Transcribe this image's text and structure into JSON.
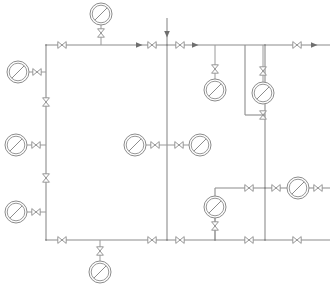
{
  "diagram": {
    "type": "p-and-id",
    "canvas": {
      "width": 330,
      "height": 290
    },
    "colors": {
      "background": "#ffffff",
      "line": "#8c8c8c",
      "symbol_fill": "#ffffff",
      "arrow": "#6e6e6e"
    },
    "legend": {
      "gauge_symbol": "pressure-gauge",
      "valve_symbol": "gate-valve-bowtie",
      "flow_symbol": "flow-direction-arrow"
    },
    "pipes": [
      {
        "name": "header-top-main",
        "orientation": "horizontal",
        "x1": 46,
        "y1": 45,
        "x2": 330,
        "y2": 45
      },
      {
        "name": "riser-left-main",
        "orientation": "vertical",
        "x1": 46,
        "y1": 45,
        "x2": 46,
        "y2": 240
      },
      {
        "name": "header-bottom-main",
        "orientation": "horizontal",
        "x1": 46,
        "y1": 240,
        "x2": 330,
        "y2": 240
      },
      {
        "name": "riser-center-main",
        "orientation": "vertical",
        "x1": 167,
        "y1": 18,
        "x2": 167,
        "y2": 240
      },
      {
        "name": "riser-right-main",
        "orientation": "vertical",
        "x1": 265,
        "y1": 45,
        "x2": 265,
        "y2": 240
      },
      {
        "name": "branch-right-mid-horizontal",
        "orientation": "horizontal",
        "x1": 215,
        "y1": 188,
        "x2": 330,
        "y2": 188
      },
      {
        "name": "branch-right-mid-drop",
        "orientation": "vertical",
        "x1": 215,
        "y1": 188,
        "x2": 215,
        "y2": 240
      },
      {
        "name": "tap-right-gauge-riser",
        "orientation": "vertical",
        "x1": 245,
        "y1": 45,
        "x2": 245,
        "y2": 115
      },
      {
        "name": "tap-right-gauge-crossover",
        "orientation": "horizontal",
        "x1": 245,
        "y1": 115,
        "x2": 265,
        "y2": 115
      }
    ],
    "gauges": [
      {
        "id": "PG-01",
        "name": "gauge-top-center",
        "cx": 101,
        "cy": 14,
        "r": 11,
        "tap": "top-header",
        "stem": {
          "x": 101,
          "y1": 25,
          "y2": 45
        }
      },
      {
        "id": "PG-02",
        "name": "gauge-left-upper",
        "cx": 18,
        "cy": 72,
        "r": 11,
        "tap": "left-riser",
        "stem": {
          "x1": 29,
          "x2": 46,
          "y": 72
        }
      },
      {
        "id": "PG-03",
        "name": "gauge-left-middle",
        "cx": 16,
        "cy": 145,
        "r": 11,
        "tap": "left-riser",
        "stem": {
          "x1": 27,
          "x2": 46,
          "y": 145
        }
      },
      {
        "id": "PG-04",
        "name": "gauge-left-lower",
        "cx": 16,
        "cy": 212,
        "r": 11,
        "tap": "left-riser",
        "stem": {
          "x1": 27,
          "x2": 46,
          "y": 212
        }
      },
      {
        "id": "PG-05",
        "name": "gauge-center-left",
        "cx": 135,
        "cy": 145,
        "r": 11,
        "tap": "center-riser",
        "stem": {
          "x1": 146,
          "x2": 167,
          "y": 145
        }
      },
      {
        "id": "PG-06",
        "name": "gauge-center-right",
        "cx": 200,
        "cy": 145,
        "r": 11,
        "tap": "center-riser",
        "stem": {
          "x1": 167,
          "x2": 189,
          "y": 145
        }
      },
      {
        "id": "PG-07",
        "name": "gauge-upper-right-a",
        "cx": 215,
        "cy": 90,
        "r": 11,
        "tap": "top-header",
        "stem": {
          "x": 215,
          "y1": 45,
          "y2": 79
        }
      },
      {
        "id": "PG-08",
        "name": "gauge-upper-right-b",
        "cx": 263,
        "cy": 93,
        "r": 11,
        "tap": "top-header",
        "stem": {
          "x": 263,
          "y1": 45,
          "y2": 82
        }
      },
      {
        "id": "PG-09",
        "name": "gauge-lower-right-branch",
        "cx": 215,
        "cy": 207,
        "r": 11,
        "tap": "branch-right-mid",
        "stem": {
          "x": 215,
          "y1": 196,
          "y2": 240
        }
      },
      {
        "id": "PG-10",
        "name": "gauge-far-right",
        "cx": 298,
        "cy": 188,
        "r": 11,
        "tap": "branch-right-mid",
        "stem": {
          "x1": 287,
          "x2": 309,
          "y": 188
        }
      },
      {
        "id": "PG-11",
        "name": "gauge-bottom-center",
        "cx": 100,
        "cy": 272,
        "r": 11,
        "tap": "bottom-header",
        "stem": {
          "x": 100,
          "y1": 240,
          "y2": 261
        }
      }
    ],
    "valves": [
      {
        "id": "V-01",
        "name": "valve-gauge-top-center",
        "cx": 101,
        "cy": 33,
        "orientation": "vertical"
      },
      {
        "id": "V-02",
        "name": "valve-top-header-left",
        "cx": 62,
        "cy": 45,
        "orientation": "horizontal"
      },
      {
        "id": "V-03",
        "name": "valve-top-header-center-left",
        "cx": 152,
        "cy": 45,
        "orientation": "horizontal"
      },
      {
        "id": "V-04",
        "name": "valve-top-header-center-right",
        "cx": 180,
        "cy": 45,
        "orientation": "horizontal"
      },
      {
        "id": "V-05",
        "name": "valve-top-header-right",
        "cx": 297,
        "cy": 45,
        "orientation": "horizontal"
      },
      {
        "id": "V-06",
        "name": "valve-gauge-left-upper",
        "cx": 37,
        "cy": 72,
        "orientation": "horizontal"
      },
      {
        "id": "V-07",
        "name": "valve-left-riser-upper",
        "cx": 46,
        "cy": 102,
        "orientation": "vertical"
      },
      {
        "id": "V-08",
        "name": "valve-left-riser-lower",
        "cx": 46,
        "cy": 178,
        "orientation": "vertical"
      },
      {
        "id": "V-09",
        "name": "valve-gauge-left-middle",
        "cx": 36,
        "cy": 145,
        "orientation": "horizontal"
      },
      {
        "id": "V-10",
        "name": "valve-gauge-left-lower",
        "cx": 36,
        "cy": 212,
        "orientation": "horizontal"
      },
      {
        "id": "V-11",
        "name": "valve-gauge-center-left",
        "cx": 155,
        "cy": 145,
        "orientation": "horizontal"
      },
      {
        "id": "V-12",
        "name": "valve-gauge-center-right",
        "cx": 179,
        "cy": 145,
        "orientation": "horizontal"
      },
      {
        "id": "V-13",
        "name": "valve-gauge-upper-right-a",
        "cx": 215,
        "cy": 69,
        "orientation": "vertical"
      },
      {
        "id": "V-14",
        "name": "valve-gauge-upper-right-b-top",
        "cx": 263,
        "cy": 71,
        "orientation": "vertical"
      },
      {
        "id": "V-15",
        "name": "valve-gauge-upper-right-b-bottom",
        "cx": 263,
        "cy": 115,
        "orientation": "vertical"
      },
      {
        "id": "V-16",
        "name": "valve-branch-right-left",
        "cx": 249,
        "cy": 188,
        "orientation": "horizontal"
      },
      {
        "id": "V-17",
        "name": "valve-branch-right-center",
        "cx": 276,
        "cy": 188,
        "orientation": "horizontal"
      },
      {
        "id": "V-18",
        "name": "valve-branch-right-far",
        "cx": 318,
        "cy": 188,
        "orientation": "horizontal"
      },
      {
        "id": "V-19",
        "name": "valve-gauge-lower-right-branch",
        "cx": 215,
        "cy": 226,
        "orientation": "vertical"
      },
      {
        "id": "V-20",
        "name": "valve-bottom-header-left",
        "cx": 62,
        "cy": 240,
        "orientation": "horizontal"
      },
      {
        "id": "V-21",
        "name": "valve-gauge-bottom-center",
        "cx": 100,
        "cy": 251,
        "orientation": "vertical"
      },
      {
        "id": "V-22",
        "name": "valve-bottom-header-center",
        "cx": 152,
        "cy": 240,
        "orientation": "horizontal"
      },
      {
        "id": "V-23",
        "name": "valve-bottom-header-right-a",
        "cx": 180,
        "cy": 240,
        "orientation": "horizontal"
      },
      {
        "id": "V-24",
        "name": "valve-bottom-header-right-b",
        "cx": 249,
        "cy": 240,
        "orientation": "horizontal"
      },
      {
        "id": "V-25",
        "name": "valve-bottom-header-far-right",
        "cx": 297,
        "cy": 240,
        "orientation": "horizontal"
      }
    ],
    "flow_arrows": [
      {
        "name": "flow-arrow-top-inlet-down",
        "x": 167,
        "y": 35,
        "direction": "down"
      },
      {
        "name": "flow-arrow-top-header-a",
        "x": 140,
        "y": 45,
        "direction": "right"
      },
      {
        "name": "flow-arrow-top-header-b",
        "x": 196,
        "y": 45,
        "direction": "right"
      },
      {
        "name": "flow-arrow-top-header-outlet",
        "x": 315,
        "y": 45,
        "direction": "right"
      }
    ],
    "junctions": [
      {
        "name": "junction-top-left",
        "x": 46,
        "y": 45
      },
      {
        "name": "junction-top-center",
        "x": 167,
        "y": 45
      },
      {
        "name": "junction-top-right",
        "x": 265,
        "y": 45
      },
      {
        "name": "junction-bottom-left",
        "x": 46,
        "y": 240
      },
      {
        "name": "junction-bottom-center",
        "x": 167,
        "y": 240
      },
      {
        "name": "junction-bottom-right",
        "x": 265,
        "y": 240
      },
      {
        "name": "junction-branch-right",
        "x": 265,
        "y": 188
      },
      {
        "name": "junction-branch-drop",
        "x": 215,
        "y": 240
      }
    ]
  }
}
